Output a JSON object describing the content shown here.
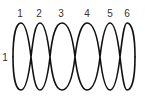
{
  "diagram": {
    "type": "chain-of-loops",
    "top_labels": [
      "1",
      "2",
      "3",
      "4",
      "5",
      "6"
    ],
    "side_label": "1",
    "stroke_color": "#111111",
    "label_color": "#333333",
    "background": "#ffffff"
  }
}
